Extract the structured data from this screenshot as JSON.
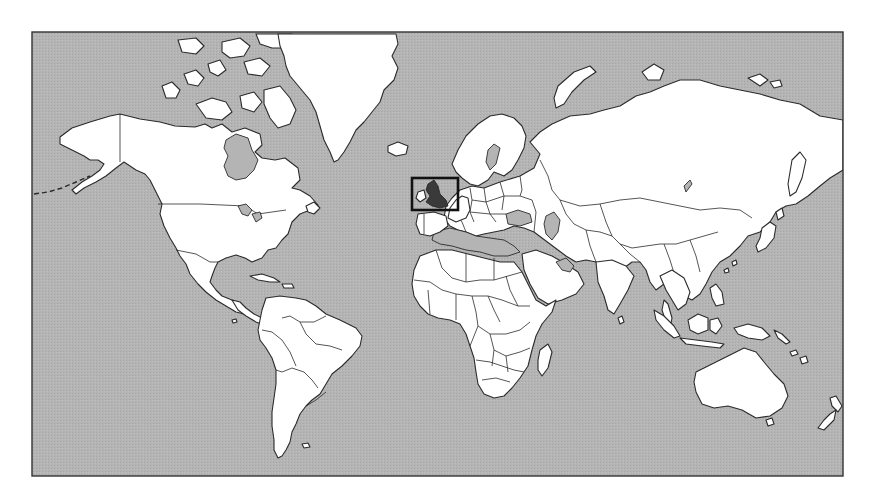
{
  "map": {
    "title": "",
    "projection": "mercator",
    "frame": {
      "x": 32,
      "y": 32,
      "width": 811,
      "height": 444
    },
    "colors": {
      "background": "#ffffff",
      "ocean": "#b4b4b4",
      "land": "#ffffff",
      "outline": "#2b2b2b",
      "highlight_fill": "#3a3a3a",
      "highlight_box": "#111111"
    },
    "highlight": {
      "region": "British Isles / United Kingdom",
      "box": {
        "x": 412,
        "y": 178,
        "width": 46,
        "height": 32
      }
    },
    "continents": [
      "North America",
      "Greenland",
      "South America",
      "Europe",
      "Africa",
      "Asia",
      "Australia",
      "New Zealand",
      "Antarctic (none shown)"
    ]
  }
}
